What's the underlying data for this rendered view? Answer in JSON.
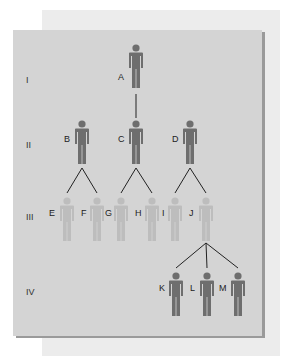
{
  "diagram": {
    "type": "pedigree",
    "colors": {
      "panel": "#d4d4d4",
      "back_panel": "#ececec",
      "affected": "#6e6e6e",
      "unaffected": "#bdbdbd",
      "line": "#222222"
    },
    "generations": [
      {
        "label": "I",
        "y": 81
      },
      {
        "label": "II",
        "y": 146
      },
      {
        "label": "III",
        "y": 218
      },
      {
        "label": "IV",
        "y": 293
      }
    ],
    "people": [
      {
        "id": "A",
        "gen": "I",
        "x": 136,
        "y": 44,
        "shade": "affected"
      },
      {
        "id": "B",
        "gen": "II",
        "x": 82,
        "y": 120,
        "shade": "affected"
      },
      {
        "id": "C",
        "gen": "II",
        "x": 136,
        "y": 120,
        "shade": "affected"
      },
      {
        "id": "D",
        "gen": "II",
        "x": 190,
        "y": 120,
        "shade": "affected"
      },
      {
        "id": "E",
        "gen": "III",
        "x": 67,
        "y": 197,
        "shade": "unaffected"
      },
      {
        "id": "F",
        "gen": "III",
        "x": 97,
        "y": 197,
        "shade": "unaffected"
      },
      {
        "id": "G",
        "gen": "III",
        "x": 121,
        "y": 197,
        "shade": "unaffected"
      },
      {
        "id": "H",
        "gen": "III",
        "x": 152,
        "y": 197,
        "shade": "unaffected"
      },
      {
        "id": "I",
        "gen": "III",
        "x": 175,
        "y": 197,
        "shade": "unaffected"
      },
      {
        "id": "J",
        "gen": "III",
        "x": 206,
        "y": 197,
        "shade": "unaffected"
      },
      {
        "id": "K",
        "gen": "IV",
        "x": 176,
        "y": 272,
        "shade": "affected"
      },
      {
        "id": "L",
        "gen": "IV",
        "x": 207,
        "y": 272,
        "shade": "affected"
      },
      {
        "id": "M",
        "gen": "IV",
        "x": 238,
        "y": 272,
        "shade": "affected"
      }
    ],
    "labels": [
      {
        "text": "A",
        "x": 118,
        "y": 78
      },
      {
        "text": "B",
        "x": 64,
        "y": 140
      },
      {
        "text": "C",
        "x": 118,
        "y": 140
      },
      {
        "text": "D",
        "x": 172,
        "y": 140
      },
      {
        "text": "E",
        "x": 49,
        "y": 214
      },
      {
        "text": "F",
        "x": 81,
        "y": 214
      },
      {
        "text": "G",
        "x": 105,
        "y": 214
      },
      {
        "text": "H",
        "x": 135,
        "y": 214
      },
      {
        "text": "I",
        "x": 162,
        "y": 214
      },
      {
        "text": "J",
        "x": 189,
        "y": 214
      },
      {
        "text": "K",
        "x": 159,
        "y": 289
      },
      {
        "text": "L",
        "x": 190,
        "y": 289
      },
      {
        "text": "M",
        "x": 219,
        "y": 289
      }
    ],
    "connections": [
      {
        "from": [
          136,
          94
        ],
        "to": [
          136,
          118
        ]
      },
      {
        "from": [
          82,
          168
        ],
        "to": [
          67,
          193
        ]
      },
      {
        "from": [
          82,
          168
        ],
        "to": [
          97,
          193
        ]
      },
      {
        "from": [
          136,
          168
        ],
        "to": [
          121,
          193
        ]
      },
      {
        "from": [
          136,
          168
        ],
        "to": [
          152,
          193
        ]
      },
      {
        "from": [
          190,
          168
        ],
        "to": [
          175,
          193
        ]
      },
      {
        "from": [
          190,
          168
        ],
        "to": [
          206,
          193
        ]
      },
      {
        "from": [
          206,
          243
        ],
        "to": [
          176,
          268
        ]
      },
      {
        "from": [
          206,
          243
        ],
        "to": [
          207,
          268
        ]
      },
      {
        "from": [
          206,
          243
        ],
        "to": [
          238,
          268
        ]
      }
    ]
  }
}
